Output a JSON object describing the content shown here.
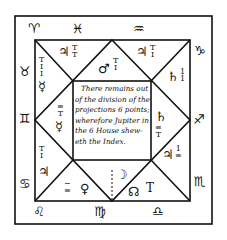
{
  "diagram": {
    "type": "astrological-horoscope-square-chart",
    "colors": {
      "ink": "#111111",
      "paper": "#ffffff"
    },
    "center_text": [
      "There remains out",
      "of the division of the",
      "projections 6 points;",
      "wherefore Jupiter in",
      "the 6 House shew-",
      "eth the Index."
    ],
    "outer_signs": {
      "top": [
        "♈",
        "♓",
        "♒"
      ],
      "right": [
        "♑",
        "♐",
        "♏"
      ],
      "bottom": [
        "♌",
        "♍",
        "♎"
      ],
      "left": [
        "♉",
        "♊",
        "♋"
      ]
    },
    "houses": [
      {
        "position": "top-left",
        "planet": "♃",
        "fraction": "T/T"
      },
      {
        "position": "top-center",
        "planet": "♂",
        "fraction": "T/I"
      },
      {
        "position": "top-right",
        "planet": "♃",
        "fraction": "T/I"
      },
      {
        "position": "right-upper",
        "planet": "♄",
        "fraction": "1/1"
      },
      {
        "position": "right-middle",
        "planet": "♄",
        "fraction": "≡/T"
      },
      {
        "position": "right-lower",
        "planet": "♃",
        "fraction": "1/≡"
      },
      {
        "position": "bottom-right",
        "planet": "☊",
        "fraction": "T"
      },
      {
        "position": "bottom-center",
        "planet": "☽",
        "fraction": ""
      },
      {
        "position": "bottom-left",
        "planet": "♀",
        "fraction": "−/≡"
      },
      {
        "position": "left-lower",
        "planet": "♃",
        "fraction": "T/I"
      },
      {
        "position": "left-middle",
        "planet": "☿",
        "fraction": "≡/T"
      },
      {
        "position": "left-upper",
        "planet": "☿",
        "fraction": "T/I/I"
      }
    ]
  }
}
